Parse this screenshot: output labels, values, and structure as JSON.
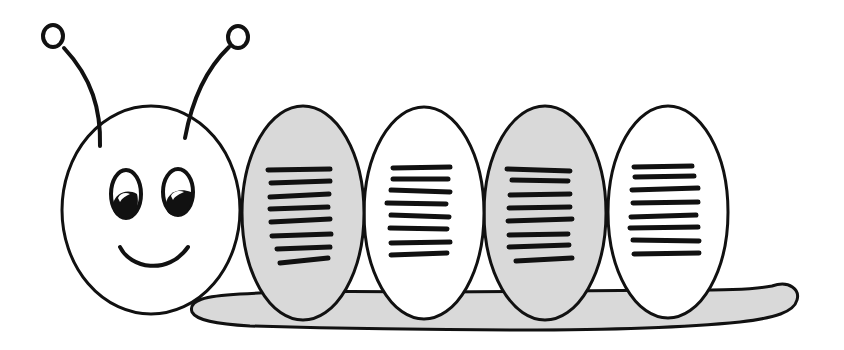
{
  "illustration": {
    "subject": "cartoon caterpillar",
    "style": "black line art with gray and white fill",
    "colors": {
      "outline": "#111111",
      "segment_gray": "#d9d9d9",
      "segment_white": "#ffffff",
      "background": "#ffffff"
    },
    "head": {
      "features": [
        "antenna-left",
        "antenna-right",
        "eye-left",
        "eye-right",
        "smile"
      ]
    },
    "segments": [
      {
        "index": 1,
        "fill": "gray",
        "stripes": 8
      },
      {
        "index": 2,
        "fill": "white",
        "stripes": 8
      },
      {
        "index": 3,
        "fill": "gray",
        "stripes": 8
      },
      {
        "index": 4,
        "fill": "white",
        "stripes": 8
      }
    ],
    "tail": {
      "fill": "gray"
    }
  }
}
